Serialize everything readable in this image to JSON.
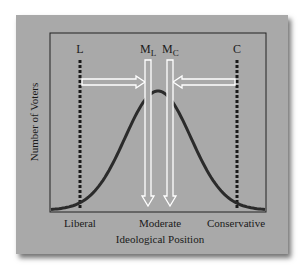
{
  "figure": {
    "ylabel": "Number of Voters",
    "xlabel": "Ideological Position",
    "x_ticks": [
      "Liberal",
      "Moderate",
      "Conservative"
    ],
    "markers": {
      "L": "L",
      "C": "C",
      "ML_main": "M",
      "ML_sub": "L",
      "MC_main": "M",
      "MC_sub": "C"
    },
    "colors": {
      "background": "#a9a9a9",
      "curve": "#2b2b2b",
      "arrows": "#ffffff",
      "dotted_lines": "#1a1a1a"
    }
  }
}
